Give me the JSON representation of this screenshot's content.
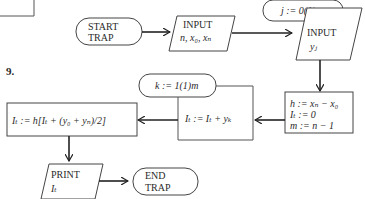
{
  "figure": {
    "number_label": "9.",
    "nodes": {
      "start": {
        "line1": "START",
        "line2": "TRAP"
      },
      "input1": {
        "line1": "INPUT",
        "line2": "n, x₀, xₙ"
      },
      "loop_j": {
        "text": "j := 0(1)n"
      },
      "input2": {
        "line1": "INPUT",
        "line2": "yⱼ"
      },
      "init": {
        "line1": "h := xₙ − x₀",
        "line2": "Iₜ := 0",
        "line3": "m := n − 1"
      },
      "loop_k": {
        "text": "k := 1(1)m"
      },
      "accumulate": {
        "text": "Iₜ := Iₜ + yₖ"
      },
      "final": {
        "text": "Iₜ := h[Iₜ + (y₀ + yₙ)/2]"
      },
      "print": {
        "line1": "PRINT",
        "line2": "Iₜ"
      },
      "end": {
        "line1": "END",
        "line2": "TRAP"
      }
    }
  }
}
